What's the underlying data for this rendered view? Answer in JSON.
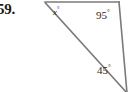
{
  "problem": {
    "number_label": "59.",
    "figure_type": "triangle-angle-diagram"
  },
  "figure": {
    "background_color": "#ffffff",
    "stroke_color": "#7a7a7a",
    "stroke_width": 1.6,
    "text_color": "#2b2b2b"
  },
  "labels": {
    "unknown_angle": {
      "value": "x",
      "degree_symbol": "°",
      "position": "top-left-vertex"
    },
    "top_right_angle": {
      "value": "95",
      "degree_symbol": "°",
      "position": "top-right-vertex"
    },
    "bottom_right_angle": {
      "value": "45",
      "degree_symbol": "°",
      "position": "bottom-right-vertex"
    }
  },
  "geometry": {
    "vertices": {
      "top_left": {
        "x": 45,
        "y": 2
      },
      "top_right": {
        "x": 119,
        "y": 2
      },
      "bottom_right": {
        "x": 127,
        "y": 92
      }
    },
    "edges": [
      {
        "name": "top-edge",
        "from": "top_left",
        "to": "top_right"
      },
      {
        "name": "right-edge",
        "from": "top_right",
        "to": "bottom_right"
      },
      {
        "name": "hypotenuse-edge",
        "from": "top_left",
        "to": "bottom_right"
      }
    ]
  }
}
